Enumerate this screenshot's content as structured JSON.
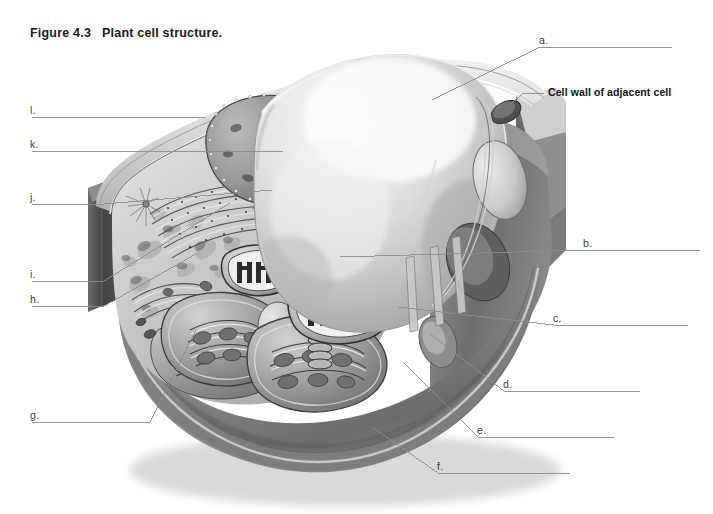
{
  "figure": {
    "title": "Figure 4.3   Plant cell structure.",
    "title_number": "Figure 4.3",
    "title_caption": "Plant cell structure.",
    "type": "labeled-diagram-worksheet",
    "background_color": "#ffffff",
    "line_color": "#8c8c8c",
    "text_color": "#3b3b3b"
  },
  "callouts": [
    {
      "key": "cell_wall_adjacent",
      "text": "Cell wall of adjacent cell",
      "bold": true,
      "x": 548,
      "y": 93
    }
  ],
  "labels": [
    {
      "id": "a",
      "text": "a.",
      "x": 540,
      "y": 42,
      "blank_end_x": 672,
      "side": "right"
    },
    {
      "id": "b",
      "text": "b.",
      "x": 584,
      "y": 245,
      "blank_end_x": 700,
      "side": "right"
    },
    {
      "id": "c",
      "text": "c.",
      "x": 554,
      "y": 320,
      "blank_end_x": 688,
      "side": "right"
    },
    {
      "id": "d",
      "text": "d.",
      "x": 504,
      "y": 386,
      "blank_end_x": 640,
      "side": "right"
    },
    {
      "id": "e",
      "text": "e.",
      "x": 478,
      "y": 432,
      "blank_end_x": 614,
      "side": "right"
    },
    {
      "id": "f",
      "text": "f.",
      "x": 438,
      "y": 468,
      "blank_end_x": 570,
      "side": "right"
    },
    {
      "id": "g",
      "text": "g.",
      "x": 32,
      "y": 417,
      "blank_end_x": 150,
      "side": "left"
    },
    {
      "id": "h",
      "text": "h.",
      "x": 32,
      "y": 300,
      "blank_end_x": 104,
      "side": "left"
    },
    {
      "id": "i",
      "text": "i.",
      "x": 32,
      "y": 276,
      "blank_end_x": 104,
      "side": "left"
    },
    {
      "id": "j",
      "text": "j.",
      "x": 32,
      "y": 198,
      "blank_end_x": 104,
      "side": "left"
    },
    {
      "id": "k",
      "text": "k.",
      "x": 32,
      "y": 146,
      "blank_end_x": 104,
      "side": "left"
    },
    {
      "id": "l",
      "text": "l.",
      "x": 32,
      "y": 112,
      "blank_end_x": 104,
      "side": "left"
    }
  ],
  "illustration": {
    "subject": "plant-cell-cutaway",
    "style": "grayscale airbrush rendering",
    "structures": [
      "cell-wall",
      "plasma-membrane",
      "central-vacuole",
      "nucleus",
      "nucleolus",
      "nuclear-envelope-pores",
      "rough-endoplasmic-reticulum",
      "smooth-endoplasmic-reticulum",
      "golgi-apparatus",
      "mitochondrion",
      "chloroplast",
      "ribosomes",
      "cytoplasm",
      "plasmodesmata",
      "cell-wall-of-adjacent-cell"
    ]
  }
}
